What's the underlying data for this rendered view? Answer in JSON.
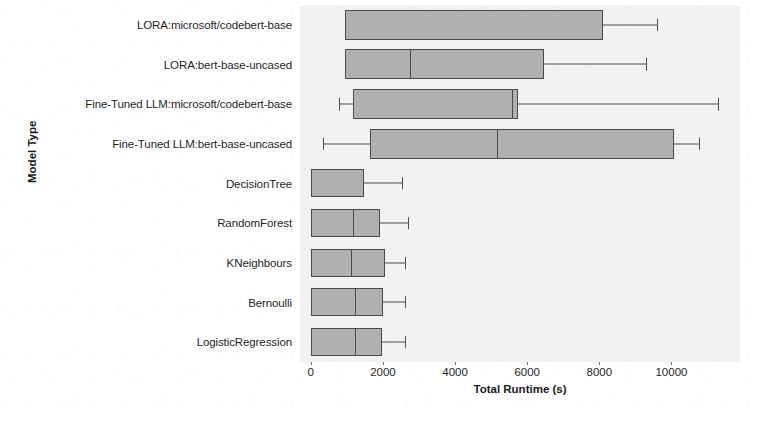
{
  "figure": {
    "background_color": "#ffffff",
    "plot_background_color": "#f2f2f2",
    "box_fill_color": "#b0b0b0",
    "box_edge_color": "#4a4a4a"
  },
  "axes": {
    "xaxis_title": "Total Runtime (s)",
    "yaxis_title": "Model Type",
    "xtick_labels": [
      "0",
      "2000",
      "4000",
      "6000",
      "8000",
      "10000"
    ]
  },
  "bleed_through_lines": [
    {
      "text": "ction",
      "x": 690,
      "y": 14
    },
    {
      "text": "the",
      "x": 706,
      "y": 44
    },
    {
      "text": "from",
      "x": 700,
      "y": 74
    },
    {
      "text": "tion",
      "x": 706,
      "y": 104
    },
    {
      "text": "ber",
      "x": 712,
      "y": 134
    },
    {
      "text": "be found with the obtained",
      "x": 400,
      "y": 196
    },
    {
      "text": "BERT and the best detection",
      "x": 404,
      "y": 222
    },
    {
      "text": "investigate the best model",
      "x": 410,
      "y": 248
    },
    {
      "text": "an optimal trade-off",
      "x": 420,
      "y": 274
    },
    {
      "text": "them. It may even still",
      "x": 414,
      "y": 300
    },
    {
      "text": "some parameters to",
      "x": 420,
      "y": 326
    }
  ],
  "chart_data": {
    "type": "box",
    "title": "",
    "xlabel": "Total Runtime (s)",
    "ylabel": "Model Type",
    "orientation": "horizontal",
    "xlim": [
      -300,
      11900
    ],
    "xticks": [
      0,
      2000,
      4000,
      6000,
      8000,
      10000
    ],
    "grid": false,
    "legend": "none",
    "categories": [
      "LORA:microsoft/codebert-base",
      "LORA:bert-base-uncased",
      "Fine-Tuned LLM:microsoft/codebert-base",
      "Fine-Tuned LLM:bert-base-uncased",
      "DecisionTree",
      "RandomForest",
      "KNeighbours",
      "Bernoulli",
      "LogisticRegression"
    ],
    "boxes": [
      {
        "category": "LORA:microsoft/codebert-base",
        "whisker_low": 950,
        "q1": 950,
        "median": 950,
        "q3": 8100,
        "whisker_high": 9600
      },
      {
        "category": "LORA:bert-base-uncased",
        "whisker_low": 950,
        "q1": 950,
        "median": 2750,
        "q3": 6470,
        "whisker_high": 9300
      },
      {
        "category": "Fine-Tuned LLM:microsoft/codebert-base",
        "whisker_low": 780,
        "q1": 1170,
        "median": 5580,
        "q3": 5750,
        "whisker_high": 11300
      },
      {
        "category": "Fine-Tuned LLM:bert-base-uncased",
        "whisker_low": 330,
        "q1": 1640,
        "median": 5170,
        "q3": 10080,
        "whisker_high": 10750
      },
      {
        "category": "DecisionTree",
        "whisker_low": 0,
        "q1": 0,
        "median": 0,
        "q3": 1470,
        "whisker_high": 2530
      },
      {
        "category": "RandomForest",
        "whisker_low": 0,
        "q1": 0,
        "median": 1170,
        "q3": 1920,
        "whisker_high": 2700
      },
      {
        "category": "KNeighbours",
        "whisker_low": 0,
        "q1": 0,
        "median": 1110,
        "q3": 2060,
        "whisker_high": 2610
      },
      {
        "category": "Bernoulli",
        "whisker_low": 0,
        "q1": 0,
        "median": 1220,
        "q3": 2000,
        "whisker_high": 2610
      },
      {
        "category": "LogisticRegression",
        "whisker_low": 0,
        "q1": 0,
        "median": 1220,
        "q3": 1970,
        "whisker_high": 2610
      }
    ]
  }
}
